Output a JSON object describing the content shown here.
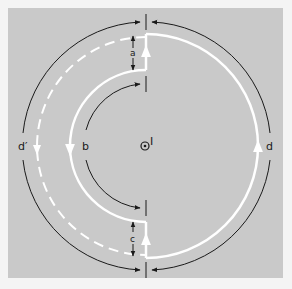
{
  "figure": {
    "background": "#c9c9c9",
    "page_background": "#f4f4f4",
    "line_color": "#1a1a1a",
    "path_color": "#ffffff"
  },
  "labels": {
    "gap_top": "a",
    "inner_path": "b",
    "gap_bottom": "c",
    "outer_path_right": "d",
    "outer_path_left": "d′",
    "current": "I"
  },
  "elements": {
    "center_symbol": "current-out-of-page-dot",
    "outer_white_loop": "closed path (solid white)",
    "left_dashed_arc": "dashed white path d′",
    "inner_white_semicircle": "path b",
    "arrows": [
      "outer arc top (toward right)",
      "outer arc bottom",
      "inner arc top",
      "inner arc bottom",
      "gap a arrows",
      "gap c arrows"
    ]
  }
}
